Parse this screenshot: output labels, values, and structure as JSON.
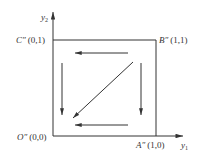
{
  "diagram": {
    "axes": {
      "x_label": "y",
      "x_label_sub": "1",
      "y_label": "y",
      "y_label_sub": "2"
    },
    "points": [
      {
        "id": "O",
        "name": "O″",
        "coord": "(0,0)"
      },
      {
        "id": "A",
        "name": "A″",
        "coord": "(1,0)"
      },
      {
        "id": "B",
        "name": "B″",
        "coord": "(1,1)"
      },
      {
        "id": "C",
        "name": "C″",
        "coord": "(0,1)"
      }
    ],
    "arrows": [
      {
        "id": "top",
        "direction": "left",
        "description": "B″ toward C″"
      },
      {
        "id": "left",
        "direction": "down",
        "description": "C″ toward O″"
      },
      {
        "id": "right",
        "direction": "down",
        "description": "B″ toward A″"
      },
      {
        "id": "bottom",
        "direction": "left",
        "description": "A″ toward O″"
      },
      {
        "id": "diagonal",
        "direction": "down-left",
        "description": "B″ toward O″"
      }
    ],
    "colors": {
      "line": "#333333",
      "background": "#ffffff"
    }
  }
}
